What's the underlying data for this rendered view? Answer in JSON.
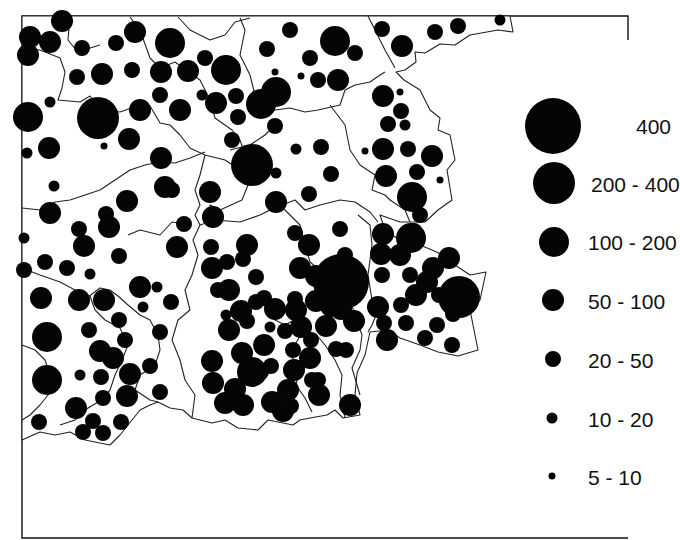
{
  "map": {
    "title": "",
    "type": "proportional-symbol dot map",
    "symbol_color": "#050505",
    "boundary_color": "#222222",
    "background_color": "#ffffff"
  },
  "legend": {
    "items": [
      {
        "label": "400",
        "class": "400+"
      },
      {
        "label": "200 - 400",
        "class": "200-400"
      },
      {
        "label": "100 - 200",
        "class": "100-200"
      },
      {
        "label": "50 - 100",
        "class": "50-100"
      },
      {
        "label": "20 - 50",
        "class": "20-50"
      },
      {
        "label": "10 - 20",
        "class": "10-20"
      },
      {
        "label": "5 - 10",
        "class": "5-10"
      }
    ]
  },
  "symbols": [
    {
      "x": 30,
      "y": 37,
      "c": 3
    },
    {
      "x": 62,
      "y": 21,
      "c": 3
    },
    {
      "x": 28,
      "y": 55,
      "c": 3
    },
    {
      "x": 50,
      "y": 42,
      "c": 3
    },
    {
      "x": 82,
      "y": 48,
      "c": 4
    },
    {
      "x": 116,
      "y": 43,
      "c": 4
    },
    {
      "x": 135,
      "y": 32,
      "c": 3
    },
    {
      "x": 102,
      "y": 74,
      "c": 3
    },
    {
      "x": 77,
      "y": 77,
      "c": 4
    },
    {
      "x": 132,
      "y": 70,
      "c": 4
    },
    {
      "x": 170,
      "y": 43,
      "c": 2
    },
    {
      "x": 188,
      "y": 71,
      "c": 3
    },
    {
      "x": 161,
      "y": 72,
      "c": 3
    },
    {
      "x": 205,
      "y": 58,
      "c": 4
    },
    {
      "x": 226,
      "y": 70,
      "c": 2
    },
    {
      "x": 236,
      "y": 96,
      "c": 4
    },
    {
      "x": 202,
      "y": 95,
      "c": 5
    },
    {
      "x": 180,
      "y": 110,
      "c": 3
    },
    {
      "x": 160,
      "y": 95,
      "c": 4
    },
    {
      "x": 216,
      "y": 103,
      "c": 3
    },
    {
      "x": 238,
      "y": 117,
      "c": 4
    },
    {
      "x": 232,
      "y": 140,
      "c": 4
    },
    {
      "x": 98,
      "y": 118,
      "c": 1
    },
    {
      "x": 140,
      "y": 110,
      "c": 3
    },
    {
      "x": 129,
      "y": 139,
      "c": 3
    },
    {
      "x": 104,
      "y": 146,
      "c": 6
    },
    {
      "x": 28,
      "y": 117,
      "c": 2
    },
    {
      "x": 49,
      "y": 148,
      "c": 3
    },
    {
      "x": 54,
      "y": 186,
      "c": 5
    },
    {
      "x": 27,
      "y": 153,
      "c": 5
    },
    {
      "x": 50,
      "y": 102,
      "c": 5
    },
    {
      "x": 290,
      "y": 30,
      "c": 4
    },
    {
      "x": 267,
      "y": 49,
      "c": 4
    },
    {
      "x": 335,
      "y": 41,
      "c": 2
    },
    {
      "x": 355,
      "y": 53,
      "c": 4
    },
    {
      "x": 310,
      "y": 58,
      "c": 4
    },
    {
      "x": 275,
      "y": 72,
      "c": 6
    },
    {
      "x": 301,
      "y": 76,
      "c": 6
    },
    {
      "x": 338,
      "y": 80,
      "c": 3
    },
    {
      "x": 318,
      "y": 80,
      "c": 4
    },
    {
      "x": 276,
      "y": 92,
      "c": 2
    },
    {
      "x": 382,
      "y": 29,
      "c": 4
    },
    {
      "x": 402,
      "y": 46,
      "c": 3
    },
    {
      "x": 435,
      "y": 32,
      "c": 4
    },
    {
      "x": 458,
      "y": 26,
      "c": 4
    },
    {
      "x": 500,
      "y": 20,
      "c": 5
    },
    {
      "x": 252,
      "y": 165,
      "c": 1
    },
    {
      "x": 275,
      "y": 126,
      "c": 4
    },
    {
      "x": 296,
      "y": 149,
      "c": 5
    },
    {
      "x": 321,
      "y": 147,
      "c": 4
    },
    {
      "x": 331,
      "y": 174,
      "c": 4
    },
    {
      "x": 276,
      "y": 202,
      "c": 3
    },
    {
      "x": 309,
      "y": 194,
      "c": 4
    },
    {
      "x": 276,
      "y": 173,
      "c": 5
    },
    {
      "x": 261,
      "y": 104,
      "c": 2
    },
    {
      "x": 210,
      "y": 192,
      "c": 3
    },
    {
      "x": 184,
      "y": 224,
      "c": 4
    },
    {
      "x": 177,
      "y": 247,
      "c": 3
    },
    {
      "x": 165,
      "y": 187,
      "c": 3
    },
    {
      "x": 161,
      "y": 158,
      "c": 3
    },
    {
      "x": 172,
      "y": 190,
      "c": 4
    },
    {
      "x": 213,
      "y": 217,
      "c": 3
    },
    {
      "x": 383,
      "y": 96,
      "c": 3
    },
    {
      "x": 400,
      "y": 92,
      "c": 6
    },
    {
      "x": 401,
      "y": 111,
      "c": 4
    },
    {
      "x": 388,
      "y": 124,
      "c": 4
    },
    {
      "x": 405,
      "y": 125,
      "c": 5
    },
    {
      "x": 383,
      "y": 149,
      "c": 3
    },
    {
      "x": 408,
      "y": 149,
      "c": 4
    },
    {
      "x": 432,
      "y": 156,
      "c": 3
    },
    {
      "x": 365,
      "y": 151,
      "c": 6
    },
    {
      "x": 386,
      "y": 176,
      "c": 3
    },
    {
      "x": 417,
      "y": 172,
      "c": 4
    },
    {
      "x": 440,
      "y": 180,
      "c": 6
    },
    {
      "x": 412,
      "y": 197,
      "c": 2
    },
    {
      "x": 420,
      "y": 215,
      "c": 4
    },
    {
      "x": 50,
      "y": 213,
      "c": 3
    },
    {
      "x": 79,
      "y": 229,
      "c": 4
    },
    {
      "x": 106,
      "y": 214,
      "c": 4
    },
    {
      "x": 127,
      "y": 201,
      "c": 3
    },
    {
      "x": 84,
      "y": 246,
      "c": 3
    },
    {
      "x": 109,
      "y": 227,
      "c": 3
    },
    {
      "x": 45,
      "y": 262,
      "c": 4
    },
    {
      "x": 67,
      "y": 268,
      "c": 4
    },
    {
      "x": 90,
      "y": 274,
      "c": 5
    },
    {
      "x": 119,
      "y": 256,
      "c": 4
    },
    {
      "x": 140,
      "y": 287,
      "c": 3
    },
    {
      "x": 157,
      "y": 287,
      "c": 5
    },
    {
      "x": 24,
      "y": 238,
      "c": 5
    },
    {
      "x": 24,
      "y": 270,
      "c": 4
    },
    {
      "x": 41,
      "y": 298,
      "c": 3
    },
    {
      "x": 79,
      "y": 300,
      "c": 3
    },
    {
      "x": 47,
      "y": 337,
      "c": 2
    },
    {
      "x": 89,
      "y": 330,
      "c": 4
    },
    {
      "x": 100,
      "y": 351,
      "c": 3
    },
    {
      "x": 47,
      "y": 380,
      "c": 2
    },
    {
      "x": 80,
      "y": 375,
      "c": 5
    },
    {
      "x": 113,
      "y": 358,
      "c": 3
    },
    {
      "x": 101,
      "y": 377,
      "c": 4
    },
    {
      "x": 103,
      "y": 398,
      "c": 4
    },
    {
      "x": 127,
      "y": 396,
      "c": 3
    },
    {
      "x": 76,
      "y": 408,
      "c": 3
    },
    {
      "x": 93,
      "y": 421,
      "c": 4
    },
    {
      "x": 121,
      "y": 422,
      "c": 4
    },
    {
      "x": 103,
      "y": 433,
      "c": 4
    },
    {
      "x": 83,
      "y": 432,
      "c": 4
    },
    {
      "x": 39,
      "y": 422,
      "c": 4
    },
    {
      "x": 130,
      "y": 374,
      "c": 3
    },
    {
      "x": 150,
      "y": 366,
      "c": 4
    },
    {
      "x": 160,
      "y": 392,
      "c": 4
    },
    {
      "x": 125,
      "y": 340,
      "c": 4
    },
    {
      "x": 119,
      "y": 320,
      "c": 4
    },
    {
      "x": 160,
      "y": 332,
      "c": 4
    },
    {
      "x": 171,
      "y": 302,
      "c": 4
    },
    {
      "x": 143,
      "y": 307,
      "c": 5
    },
    {
      "x": 104,
      "y": 300,
      "c": 3
    },
    {
      "x": 211,
      "y": 247,
      "c": 4
    },
    {
      "x": 227,
      "y": 262,
      "c": 4
    },
    {
      "x": 247,
      "y": 245,
      "c": 3
    },
    {
      "x": 243,
      "y": 259,
      "c": 4
    },
    {
      "x": 256,
      "y": 277,
      "c": 4
    },
    {
      "x": 264,
      "y": 298,
      "c": 4
    },
    {
      "x": 218,
      "y": 290,
      "c": 4
    },
    {
      "x": 229,
      "y": 290,
      "c": 3
    },
    {
      "x": 241,
      "y": 311,
      "c": 3
    },
    {
      "x": 229,
      "y": 330,
      "c": 3
    },
    {
      "x": 212,
      "y": 361,
      "c": 3
    },
    {
      "x": 213,
      "y": 383,
      "c": 3
    },
    {
      "x": 235,
      "y": 389,
      "c": 3
    },
    {
      "x": 261,
      "y": 372,
      "c": 4
    },
    {
      "x": 264,
      "y": 345,
      "c": 3
    },
    {
      "x": 242,
      "y": 353,
      "c": 3
    },
    {
      "x": 270,
      "y": 327,
      "c": 5
    },
    {
      "x": 275,
      "y": 309,
      "c": 3
    },
    {
      "x": 295,
      "y": 299,
      "c": 4
    },
    {
      "x": 285,
      "y": 331,
      "c": 4
    },
    {
      "x": 212,
      "y": 268,
      "c": 3
    },
    {
      "x": 226,
      "y": 315,
      "c": 5
    },
    {
      "x": 247,
      "y": 321,
      "c": 4
    },
    {
      "x": 252,
      "y": 372,
      "c": 2
    },
    {
      "x": 272,
      "y": 402,
      "c": 3
    },
    {
      "x": 288,
      "y": 390,
      "c": 3
    },
    {
      "x": 283,
      "y": 411,
      "c": 3
    },
    {
      "x": 294,
      "y": 370,
      "c": 3
    },
    {
      "x": 293,
      "y": 350,
      "c": 4
    },
    {
      "x": 319,
      "y": 395,
      "c": 3
    },
    {
      "x": 346,
      "y": 350,
      "c": 4
    },
    {
      "x": 336,
      "y": 349,
      "c": 4
    },
    {
      "x": 243,
      "y": 405,
      "c": 3
    },
    {
      "x": 291,
      "y": 406,
      "c": 4
    },
    {
      "x": 225,
      "y": 403,
      "c": 3
    },
    {
      "x": 312,
      "y": 380,
      "c": 4
    },
    {
      "x": 310,
      "y": 358,
      "c": 3
    },
    {
      "x": 296,
      "y": 310,
      "c": 3
    },
    {
      "x": 316,
      "y": 276,
      "c": 3
    },
    {
      "x": 300,
      "y": 268,
      "c": 3
    },
    {
      "x": 256,
      "y": 302,
      "c": 4
    },
    {
      "x": 234,
      "y": 388,
      "c": 5
    },
    {
      "x": 271,
      "y": 366,
      "c": 4
    },
    {
      "x": 295,
      "y": 233,
      "c": 4
    },
    {
      "x": 340,
      "y": 229,
      "c": 4
    },
    {
      "x": 309,
      "y": 245,
      "c": 3
    },
    {
      "x": 345,
      "y": 255,
      "c": 4
    },
    {
      "x": 341,
      "y": 283,
      "c": 1
    },
    {
      "x": 316,
      "y": 301,
      "c": 3
    },
    {
      "x": 301,
      "y": 327,
      "c": 3
    },
    {
      "x": 326,
      "y": 326,
      "c": 3
    },
    {
      "x": 331,
      "y": 306,
      "c": 3
    },
    {
      "x": 354,
      "y": 321,
      "c": 3
    },
    {
      "x": 350,
      "y": 405,
      "c": 3
    },
    {
      "x": 318,
      "y": 380,
      "c": 4
    },
    {
      "x": 311,
      "y": 340,
      "c": 4
    },
    {
      "x": 341,
      "y": 309,
      "c": 3
    },
    {
      "x": 383,
      "y": 234,
      "c": 3
    },
    {
      "x": 414,
      "y": 231,
      "c": 4
    },
    {
      "x": 381,
      "y": 254,
      "c": 3
    },
    {
      "x": 400,
      "y": 255,
      "c": 3
    },
    {
      "x": 382,
      "y": 275,
      "c": 4
    },
    {
      "x": 410,
      "y": 275,
      "c": 4
    },
    {
      "x": 433,
      "y": 268,
      "c": 3
    },
    {
      "x": 449,
      "y": 258,
      "c": 3
    },
    {
      "x": 439,
      "y": 295,
      "c": 4
    },
    {
      "x": 416,
      "y": 295,
      "c": 3
    },
    {
      "x": 406,
      "y": 323,
      "c": 4
    },
    {
      "x": 425,
      "y": 338,
      "c": 4
    },
    {
      "x": 437,
      "y": 325,
      "c": 4
    },
    {
      "x": 453,
      "y": 314,
      "c": 4
    },
    {
      "x": 464,
      "y": 289,
      "c": 3
    },
    {
      "x": 452,
      "y": 345,
      "c": 4
    },
    {
      "x": 427,
      "y": 282,
      "c": 3
    },
    {
      "x": 378,
      "y": 307,
      "c": 3
    },
    {
      "x": 459,
      "y": 297,
      "c": 1
    },
    {
      "x": 401,
      "y": 305,
      "c": 4
    },
    {
      "x": 384,
      "y": 323,
      "c": 4
    },
    {
      "x": 387,
      "y": 340,
      "c": 3
    },
    {
      "x": 411,
      "y": 238,
      "c": 2
    },
    {
      "x": 341,
      "y": 282,
      "c": 0
    }
  ],
  "chart_data": {
    "type": "scatter",
    "title": "",
    "xlabel": "",
    "ylabel": "",
    "legend_position": "right",
    "size_classes": [
      "400",
      "200 - 400",
      "100 - 200",
      "50 - 100",
      "20 - 50",
      "10 - 20",
      "5 - 10"
    ],
    "note": "Proportional-symbol map; each point is a settlement whose symbol size falls in one of the legend classes"
  }
}
